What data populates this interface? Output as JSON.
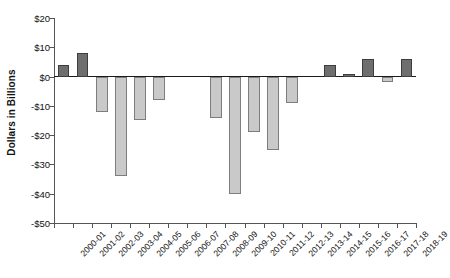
{
  "chart_data": {
    "type": "bar",
    "title": "",
    "subtitle": "",
    "xlabel": "",
    "ylabel": "Dollars in Billions",
    "ylim": [
      -50,
      20
    ],
    "grid": false,
    "legend": null,
    "y_ticks": [
      20,
      10,
      0,
      -10,
      -20,
      -30,
      -40,
      -50
    ],
    "y_tick_labels": [
      "$20",
      "$10",
      "$0",
      "-$10",
      "-$20",
      "-$30",
      "-$40",
      "-$50"
    ],
    "categories": [
      "2000-01",
      "2001-02",
      "2002-03",
      "2003-04",
      "2004-05",
      "2005-06",
      "2006-07",
      "2007-08",
      "2008-09",
      "2009-10",
      "2010-11",
      "2011-12",
      "2012-13",
      "2013-14",
      "2014-15",
      "2015-16",
      "2016-17",
      "2017-18",
      "2018-19"
    ],
    "values": [
      4,
      8,
      -12,
      -34,
      -15,
      -8,
      0,
      0,
      -14,
      -40,
      -19,
      -25,
      -9,
      0,
      4,
      1,
      6,
      -2,
      6
    ],
    "colors": {
      "positive": "#6e6e6e",
      "negative": "#c9c9c9",
      "axis": "#555555",
      "zero_line": "#1a1a1a",
      "text": "#111111",
      "background": "#ffffff"
    }
  }
}
